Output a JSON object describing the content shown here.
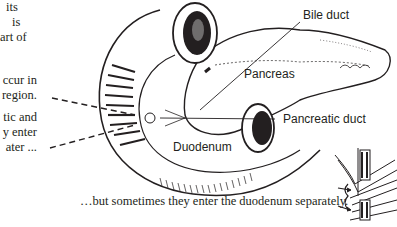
{
  "side_text": {
    "block1": [
      "its",
      "is",
      "art of"
    ],
    "block2": [
      "ccur in",
      "region."
    ],
    "block3": [
      "tic and",
      "y enter",
      "ater ..."
    ]
  },
  "labels": {
    "bile_duct": "Bile duct",
    "pancreas": "Pancreas",
    "pancreatic_duct": "Pancreatic duct",
    "duodenum": "Duodenum"
  },
  "caption": "…but sometimes they enter the duodenum separately.",
  "colors": {
    "ink": "#231f20",
    "background": "#ffffff"
  }
}
